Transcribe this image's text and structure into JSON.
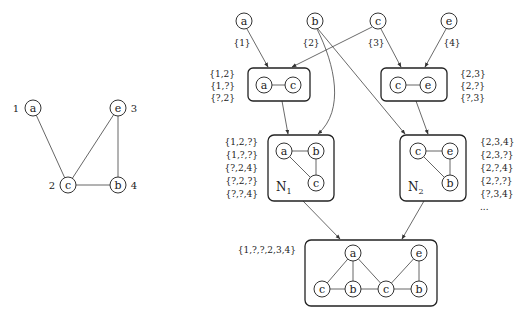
{
  "left_graph": {
    "nodes": [
      {
        "id": "a",
        "index": "1",
        "x": 33,
        "y": 108,
        "label_x": 20,
        "label_y": 112
      },
      {
        "id": "e",
        "index": "3",
        "x": 118,
        "y": 108,
        "label_x": 130,
        "label_y": 112
      },
      {
        "id": "c",
        "index": "2",
        "x": 68,
        "y": 185,
        "label_x": 55,
        "label_y": 189
      },
      {
        "id": "b",
        "index": "4",
        "x": 118,
        "y": 185,
        "label_x": 130,
        "label_y": 189
      }
    ],
    "edges": [
      [
        "a",
        "c"
      ],
      [
        "c",
        "e"
      ],
      [
        "c",
        "b"
      ],
      [
        "e",
        "b"
      ]
    ]
  },
  "top_nodes": [
    {
      "id": "a",
      "set": "{1}"
    },
    {
      "id": "b",
      "set": "{2}"
    },
    {
      "id": "c",
      "set": "{3}"
    },
    {
      "id": "e",
      "set": "{4}"
    }
  ],
  "box_ac": {
    "nodes": [
      "a",
      "c"
    ],
    "sets": [
      "{1,2}",
      "{1,?}",
      "{?,2}"
    ]
  },
  "box_ce": {
    "nodes": [
      "c",
      "e"
    ],
    "sets": [
      "{2,3}",
      "{2,?}",
      "{?,3}"
    ]
  },
  "box_n1": {
    "name": "N",
    "subscript": "1",
    "nodes": [
      "a",
      "b",
      "c"
    ],
    "sets": [
      "{1,2,?}",
      "{1,?,?}",
      "{?,2,4}",
      "{?,2,?}",
      "{?,?,4}"
    ]
  },
  "box_n2": {
    "name": "N",
    "subscript": "2",
    "nodes": [
      "c",
      "e",
      "b"
    ],
    "sets": [
      "{2,3,4}",
      "{2,3,?}",
      "{2,?,4}",
      "{2,?,?}",
      "{?,3,4}",
      "..."
    ]
  },
  "box_final": {
    "nodes": [
      "a",
      "e",
      "c",
      "b",
      "c",
      "b"
    ],
    "set": "{1,?,?,2,3,4}"
  },
  "colors": {
    "stroke": "#333333",
    "text": "#222222",
    "background": "#ffffff"
  }
}
